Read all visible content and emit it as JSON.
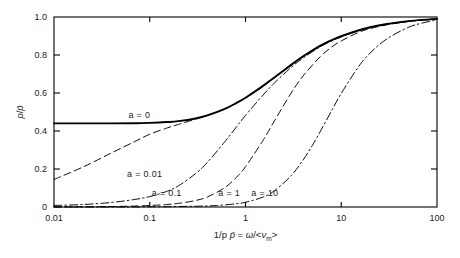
{
  "figure": {
    "background_color": "#ffffff",
    "line_color": "#000000"
  },
  "chart_data": {
    "type": "line",
    "title": "",
    "subtitle": "",
    "xlabel": "1/p p̄ = ω/<ν_m>",
    "xlabel_parts": {
      "lead": "1/p ",
      "pbar": "p̄",
      "eq": " = ",
      "omega": "ω",
      "slash": "/<",
      "nu": "ν",
      "sub": "m",
      "close": ">"
    },
    "ylabel": "p/p̄",
    "ylabel_parts": {
      "num": "p",
      "slash": "/",
      "den": "p̄"
    },
    "xscale": "log",
    "yscale": "linear",
    "xlim": [
      0.01,
      100
    ],
    "ylim": [
      0,
      1.0
    ],
    "grid": false,
    "legend_position": "inline-annotations",
    "xticks": [
      0.01,
      0.1,
      1,
      10,
      100
    ],
    "xticklabels": [
      "0.01",
      "0.1",
      "1",
      "10",
      "100"
    ],
    "yticks": [
      0,
      0.2,
      0.4,
      0.6,
      0.8,
      1.0
    ],
    "yticklabels": [
      "0",
      "0.2",
      "0.4",
      "0.6",
      "0.8",
      "1.0"
    ],
    "minor_ticks": false,
    "series": [
      {
        "name": "a = 0",
        "label": "a = 0",
        "linestyle": "solid",
        "linewidth": 1.9,
        "label_x": 0.06,
        "label_y": 0.485,
        "x": [
          0.01,
          0.02,
          0.04,
          0.07,
          0.1,
          0.15,
          0.2,
          0.3,
          0.4,
          0.6,
          0.8,
          1.0,
          1.5,
          2.0,
          3.0,
          4.0,
          6.0,
          8.0,
          10.0,
          15.0,
          20.0,
          30.0,
          50.0,
          70.0,
          100.0
        ],
        "y": [
          0.44,
          0.44,
          0.44,
          0.441,
          0.443,
          0.447,
          0.452,
          0.466,
          0.482,
          0.515,
          0.547,
          0.575,
          0.635,
          0.682,
          0.748,
          0.793,
          0.848,
          0.879,
          0.899,
          0.929,
          0.946,
          0.963,
          0.978,
          0.985,
          0.99
        ]
      },
      {
        "name": "a = 0.01",
        "label": "a = 0.01",
        "linestyle": "dashed",
        "linewidth": 0.95,
        "label_x": 0.058,
        "label_y": 0.175,
        "x": [
          0.01,
          0.02,
          0.04,
          0.07,
          0.1,
          0.15,
          0.2,
          0.3,
          0.4,
          0.6,
          0.8,
          1.0,
          1.5,
          2.0,
          3.0,
          4.0,
          6.0,
          8.0,
          10.0,
          15.0,
          20.0,
          30.0,
          50.0,
          70.0,
          100.0
        ],
        "y": [
          0.145,
          0.21,
          0.285,
          0.345,
          0.383,
          0.415,
          0.435,
          0.462,
          0.482,
          0.515,
          0.546,
          0.573,
          0.633,
          0.68,
          0.746,
          0.791,
          0.846,
          0.877,
          0.897,
          0.928,
          0.945,
          0.962,
          0.977,
          0.984,
          0.99
        ]
      },
      {
        "name": "a = 0.1",
        "label": "a = 0.1",
        "linestyle": "dashdot",
        "linewidth": 0.95,
        "label_x": 0.105,
        "label_y": 0.075,
        "x": [
          0.01,
          0.02,
          0.04,
          0.07,
          0.1,
          0.15,
          0.2,
          0.3,
          0.4,
          0.6,
          0.8,
          1.0,
          1.5,
          2.0,
          3.0,
          4.0,
          6.0,
          8.0,
          10.0,
          15.0,
          20.0,
          30.0,
          50.0,
          70.0,
          100.0
        ],
        "y": [
          0.008,
          0.013,
          0.024,
          0.04,
          0.055,
          0.082,
          0.112,
          0.175,
          0.235,
          0.34,
          0.42,
          0.482,
          0.585,
          0.652,
          0.735,
          0.784,
          0.843,
          0.874,
          0.895,
          0.927,
          0.944,
          0.962,
          0.977,
          0.984,
          0.99
        ]
      },
      {
        "name": "a = 1",
        "label": "a = 1",
        "linestyle": "dashed",
        "linewidth": 0.95,
        "label_x": 0.52,
        "label_y": 0.075,
        "x": [
          0.01,
          0.03,
          0.06,
          0.1,
          0.15,
          0.2,
          0.3,
          0.4,
          0.6,
          0.8,
          1.0,
          1.5,
          2.0,
          3.0,
          4.0,
          6.0,
          8.0,
          10.0,
          15.0,
          20.0,
          30.0,
          50.0,
          70.0,
          100.0
        ],
        "y": [
          0.0,
          0.002,
          0.004,
          0.008,
          0.013,
          0.019,
          0.034,
          0.053,
          0.1,
          0.155,
          0.212,
          0.345,
          0.452,
          0.6,
          0.69,
          0.79,
          0.843,
          0.874,
          0.918,
          0.939,
          0.959,
          0.976,
          0.984,
          0.99
        ]
      },
      {
        "name": "a = 10",
        "label": "a = 10",
        "linestyle": "dashdot",
        "linewidth": 0.95,
        "label_x": 1.15,
        "label_y": 0.075,
        "x": [
          0.01,
          0.05,
          0.1,
          0.3,
          0.5,
          0.8,
          1.0,
          1.5,
          2.0,
          3.0,
          4.0,
          5.0,
          6.0,
          8.0,
          10.0,
          15.0,
          20.0,
          30.0,
          50.0,
          70.0,
          100.0
        ],
        "y": [
          0.0,
          0.0,
          0.001,
          0.004,
          0.008,
          0.017,
          0.025,
          0.051,
          0.085,
          0.165,
          0.248,
          0.325,
          0.395,
          0.51,
          0.598,
          0.735,
          0.81,
          0.885,
          0.945,
          0.968,
          0.985
        ]
      }
    ]
  }
}
